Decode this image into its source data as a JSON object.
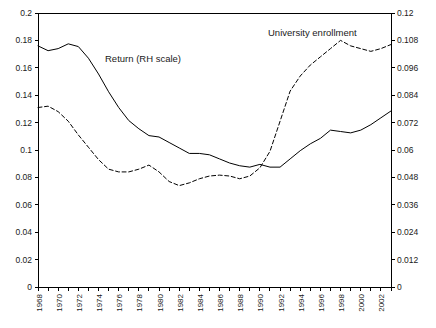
{
  "chart_data": {
    "type": "line",
    "title": "",
    "subtitle": "",
    "xlabel": "",
    "ylabel": "",
    "y2label": "",
    "grid": false,
    "legend_position": "inline-annotations",
    "x": [
      1968,
      1969,
      1970,
      1971,
      1972,
      1973,
      1974,
      1975,
      1976,
      1977,
      1978,
      1979,
      1980,
      1981,
      1982,
      1983,
      1984,
      1985,
      1986,
      1987,
      1988,
      1989,
      1990,
      1991,
      1992,
      1993,
      1994,
      1995,
      1996,
      1997,
      1998,
      1999,
      2000,
      2001,
      2002,
      2003
    ],
    "xlim": [
      1968,
      2003
    ],
    "ylim": [
      0,
      0.2
    ],
    "y2lim": [
      0,
      0.12
    ],
    "xticks": [
      1968,
      1970,
      1972,
      1974,
      1976,
      1978,
      1980,
      1982,
      1984,
      1986,
      1988,
      1990,
      1992,
      1994,
      1996,
      1998,
      2000,
      2002
    ],
    "xticklabels": [
      "1968",
      "1970",
      "1972",
      "1974",
      "1976",
      "1978",
      "1980",
      "1982",
      "1984",
      "1986",
      "1988",
      "1990",
      "1992",
      "1994",
      "1996",
      "1998",
      "2000",
      "2002"
    ],
    "yticks": [
      0,
      0.02,
      0.04,
      0.06,
      0.08,
      0.1,
      0.12,
      0.14,
      0.16,
      0.18,
      0.2
    ],
    "yticklabels": [
      "0",
      "0.02",
      "0.04",
      "0.06",
      "0.08",
      "0.1",
      "0.12",
      "0.14",
      "0.16",
      "0.18",
      "0.2"
    ],
    "y2ticks": [
      0,
      0.012,
      0.024,
      0.036,
      0.048,
      0.06,
      0.072,
      0.084,
      0.096,
      0.108,
      0.12
    ],
    "y2ticklabels": [
      "0",
      "0.012",
      "0.024",
      "0.036",
      "0.048",
      "0.06",
      "0.072",
      "0.084",
      "0.096",
      "0.108",
      "0.12"
    ],
    "series": [
      {
        "name": "University enrollment",
        "axis": "left",
        "style": "solid",
        "color": "#000000",
        "values": [
          0.176,
          0.1725,
          0.174,
          0.1775,
          0.1755,
          0.167,
          0.1555,
          0.1425,
          0.131,
          0.1215,
          0.1155,
          0.1105,
          0.1095,
          0.1055,
          0.1015,
          0.0975,
          0.0975,
          0.0965,
          0.0935,
          0.0905,
          0.0885,
          0.0875,
          0.0895,
          0.0875,
          0.0875,
          0.0935,
          0.0995,
          0.1045,
          0.1085,
          0.1145,
          0.1135,
          0.1125,
          0.1145,
          0.1185,
          0.1235,
          0.1285
        ]
      },
      {
        "name": "Return (RH scale)",
        "axis": "right",
        "style": "dashed",
        "color": "#000000",
        "values": [
          0.0786,
          0.0792,
          0.0768,
          0.0726,
          0.0666,
          0.0612,
          0.0558,
          0.0516,
          0.0504,
          0.0504,
          0.0516,
          0.0534,
          0.0504,
          0.0462,
          0.0444,
          0.0456,
          0.0474,
          0.0486,
          0.049,
          0.0486,
          0.0474,
          0.0486,
          0.0522,
          0.0594,
          0.0726,
          0.0858,
          0.0924,
          0.0972,
          0.1008,
          0.1044,
          0.108,
          0.1056,
          0.1044,
          0.1032,
          0.1044,
          0.1062
        ]
      }
    ],
    "annotations": [
      {
        "text": "Return (RH scale)",
        "x_px": 105,
        "y_px": 62,
        "series": "Return (RH scale)"
      },
      {
        "text": "University enrollment",
        "x_px": 268,
        "y_px": 36,
        "series": "University enrollment"
      }
    ],
    "colors": {
      "background": "#ffffff",
      "axis": "#000000",
      "line": "#000000",
      "text": "#1a1a1a"
    }
  }
}
